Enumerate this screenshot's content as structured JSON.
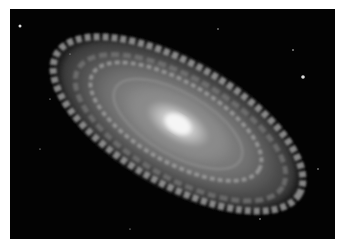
{
  "image": {
    "subject": "Spiral galaxy",
    "description": "Grayscale photograph of a spiral galaxy with a bright central core and tightly wound arms, tilted diagonally against a black starfield",
    "colors": {
      "background": "#030303",
      "border": "#ffffff",
      "core": "#f2f2f2",
      "arms": "#9a9a9a"
    }
  }
}
